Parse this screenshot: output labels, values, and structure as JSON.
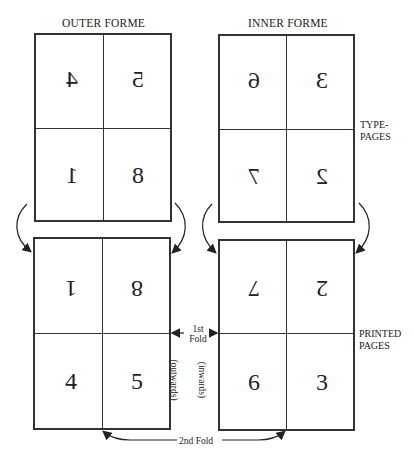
{
  "titles": {
    "outer": "OUTER FORME",
    "inner": "INNER FORME"
  },
  "side_labels": {
    "type_pages_1": "TYPE-",
    "type_pages_2": "PAGES",
    "printed_pages_1": "PRINTED",
    "printed_pages_2": "PAGES"
  },
  "fold_labels": {
    "first_1": "1st",
    "first_2": "Fold",
    "second": "2nd Fold",
    "outwards": "(outwards)",
    "inwards": "(inwards)"
  },
  "outer_type": {
    "top_left": "4",
    "top_right": "5",
    "bottom_left": "1",
    "bottom_right": "8"
  },
  "inner_type": {
    "top_left": "6",
    "top_right": "3",
    "bottom_left": "7",
    "bottom_right": "2"
  },
  "outer_printed": {
    "top_left": "1",
    "top_right": "8",
    "bottom_left": "4",
    "bottom_right": "5"
  },
  "inner_printed": {
    "top_left": "7",
    "top_right": "2",
    "bottom_left": "6",
    "bottom_right": "3"
  }
}
